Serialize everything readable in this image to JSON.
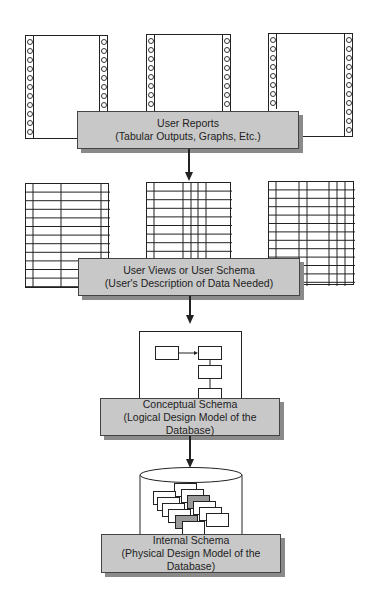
{
  "diagram": {
    "levels": [
      {
        "id": "user-reports",
        "title": "User Reports",
        "subtitle": "(Tabular Outputs, Graphs, Etc.)"
      },
      {
        "id": "user-views",
        "title": "User Views or User Schema",
        "subtitle": "(User's Description of Data Needed)"
      },
      {
        "id": "conceptual-schema",
        "title": "Conceptual Schema",
        "subtitle": "(Logical Design Model of the Database)"
      },
      {
        "id": "internal-schema",
        "title": "Internal Schema",
        "subtitle": "(Physical Design Model of the Database)"
      }
    ],
    "colors": {
      "box_fill": "#c8c8c8",
      "box_shadow": "#8a8a8a",
      "line": "#222222",
      "dark_file": "#9a9a9a"
    }
  }
}
